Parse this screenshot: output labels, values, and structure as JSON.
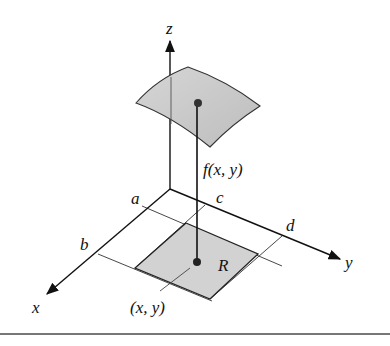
{
  "figure": {
    "labels": {
      "z_axis": "z",
      "x_axis": "x",
      "y_axis": "y",
      "a": "a",
      "b": "b",
      "c": "c",
      "d": "d",
      "region": "R",
      "function": "f(x, y)",
      "point": "(x, y)"
    },
    "colors": {
      "surface_fill": "#c9c9c9",
      "region_fill": "#d4d4d4",
      "line": "#1a1a1a",
      "rule": "#777777"
    }
  }
}
